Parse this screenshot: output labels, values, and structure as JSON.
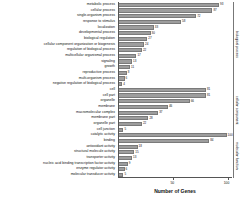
{
  "chart_data": {
    "type": "bar",
    "orientation": "horizontal",
    "title": "",
    "xlabel": "Number of Genes",
    "ylabel": "",
    "xlim": [
      0,
      105
    ],
    "grid": false,
    "legend": false,
    "tick_labels": [
      "50",
      "100"
    ],
    "tick_values": [
      50,
      100
    ],
    "categories": [
      "metabolic process",
      "cellular process",
      "single-organism process",
      "response to stimulus",
      "localization",
      "developmental process",
      "biological regulation",
      "cellular component organization or biogenesis",
      "regulation of biological process",
      "multicellular organismal process",
      "signaling",
      "growth",
      "reproductive process",
      "multi-organism process",
      "negative regulation of biological process",
      "cell",
      "cell part",
      "organelle",
      "membrane",
      "macromolecular complex",
      "membrane part",
      "organelle part",
      "cell junction",
      "catalytic activity",
      "binding",
      "antioxidant activity",
      "structural molecule activity",
      "transporter activity",
      "nucleic acid binding transcription factor activity",
      "enzyme regulator activity",
      "molecular transducer activity"
    ],
    "values": [
      93,
      87,
      72,
      58,
      33,
      30,
      27,
      24,
      22,
      17,
      13,
      11,
      8,
      6,
      4,
      81,
      81,
      66,
      46,
      37,
      28,
      22,
      5,
      100,
      84,
      18,
      15,
      13,
      9,
      6,
      5
    ],
    "value_labels": [
      "93",
      "87",
      "72",
      "58",
      "33",
      "30",
      "27",
      "24",
      "22",
      "17",
      "13",
      "11",
      "8",
      "6",
      "4",
      "81",
      "81",
      "66",
      "46",
      "37",
      "28",
      "22",
      "5",
      "100",
      "84",
      "18",
      "15",
      "13",
      "9",
      "6",
      "5"
    ],
    "groups": [
      {
        "label": "biological process",
        "start": 0,
        "end": 14
      },
      {
        "label": "cellular component",
        "start": 15,
        "end": 22
      },
      {
        "label": "molecular function",
        "start": 23,
        "end": 30
      }
    ],
    "bar_color": "#9d9d9d",
    "bar_edge_color": "#7a7a7a",
    "axis_color": "#555555",
    "text_color": "#111111"
  }
}
